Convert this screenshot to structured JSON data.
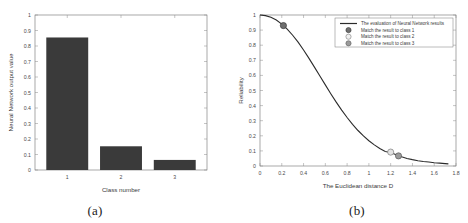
{
  "figure": {
    "caption_a": "(a)",
    "caption_b": "(b)"
  },
  "chart_data": [
    {
      "id": "panel-a",
      "type": "bar",
      "title": "",
      "xlabel": "Class number",
      "ylabel": "Neural Network output value",
      "categories": [
        "1",
        "2",
        "3"
      ],
      "values": [
        0.855,
        0.153,
        0.065
      ],
      "xlim": [
        0.4,
        3.6
      ],
      "ylim": [
        0,
        1
      ],
      "ytick_labels": [
        "0",
        "0.1",
        "0.2",
        "0.3",
        "0.4",
        "0.5",
        "0.6",
        "0.7",
        "0.8",
        "0.9",
        "1"
      ],
      "ytick_values": [
        0,
        0.1,
        0.2,
        0.3,
        0.4,
        0.5,
        0.6,
        0.7,
        0.8,
        0.9,
        1
      ],
      "xtick_labels": [
        "1",
        "2",
        "3"
      ],
      "xtick_values": [
        1,
        2,
        3
      ],
      "bar_color": "#3a3a3a",
      "grid": false,
      "legend": "none"
    },
    {
      "id": "panel-b",
      "type": "line",
      "title": "",
      "xlabel": "The Euclidean distance D",
      "ylabel": "Reliability",
      "xlim": [
        0,
        1.8
      ],
      "ylim": [
        0,
        1
      ],
      "xtick_labels": [
        "0",
        "0.2",
        "0.4",
        "0.6",
        "0.8",
        "1",
        "1.2",
        "1.4",
        "1.6",
        "1.8"
      ],
      "xtick_values": [
        0,
        0.2,
        0.4,
        0.6,
        0.8,
        1.0,
        1.2,
        1.4,
        1.6,
        1.8
      ],
      "ytick_labels": [
        "0",
        "0.1",
        "0.2",
        "0.3",
        "0.4",
        "0.5",
        "0.6",
        "0.7",
        "0.8",
        "0.9",
        "1"
      ],
      "ytick_values": [
        0,
        0.1,
        0.2,
        0.3,
        0.4,
        0.5,
        0.6,
        0.7,
        0.8,
        0.9,
        1
      ],
      "grid": false,
      "legend_position": "upper right",
      "series": [
        {
          "name": "The evaluation of Neural Network results",
          "kind": "line",
          "color": "#2b2b2b",
          "x": [
            0.0,
            0.05,
            0.1,
            0.15,
            0.2,
            0.25,
            0.3,
            0.35,
            0.4,
            0.45,
            0.5,
            0.55,
            0.6,
            0.65,
            0.7,
            0.75,
            0.8,
            0.85,
            0.9,
            0.95,
            1.0,
            1.05,
            1.1,
            1.15,
            1.2,
            1.25,
            1.3,
            1.35,
            1.4,
            1.45,
            1.5,
            1.55,
            1.6,
            1.65,
            1.7,
            1.73
          ],
          "y": [
            1.0,
            0.996,
            0.985,
            0.967,
            0.94,
            0.907,
            0.866,
            0.82,
            0.768,
            0.713,
            0.655,
            0.596,
            0.537,
            0.479,
            0.423,
            0.37,
            0.321,
            0.276,
            0.235,
            0.199,
            0.167,
            0.14,
            0.116,
            0.096,
            0.09,
            0.075,
            0.061,
            0.05,
            0.042,
            0.035,
            0.03,
            0.026,
            0.022,
            0.019,
            0.016,
            0.014
          ]
        }
      ],
      "markers": [
        {
          "name": "Match the result to class 1",
          "x": 0.215,
          "y": 0.93,
          "color": "#6e6e6e",
          "edge": "#3a3a3a"
        },
        {
          "name": "Match the result to class 2",
          "x": 1.2,
          "y": 0.092,
          "color": "#e2e2e2",
          "edge": "#7c7c7c"
        },
        {
          "name": "Match the result to class 3",
          "x": 1.272,
          "y": 0.067,
          "color": "#9a9a9a",
          "edge": "#5a5a5a"
        }
      ],
      "legend_entries": [
        {
          "label": "The evaluation of Neural Network results",
          "symbol": "line",
          "color": "#2b2b2b"
        },
        {
          "label": "Match the result to class 1",
          "symbol": "circle",
          "color": "#6e6e6e",
          "edge": "#3a3a3a"
        },
        {
          "label": "Match the result to class 2",
          "symbol": "circle",
          "color": "#f0f0f0",
          "edge": "#7c7c7c"
        },
        {
          "label": "Match the result to class 3",
          "symbol": "circle",
          "color": "#9a9a9a",
          "edge": "#5a5a5a"
        }
      ]
    }
  ]
}
